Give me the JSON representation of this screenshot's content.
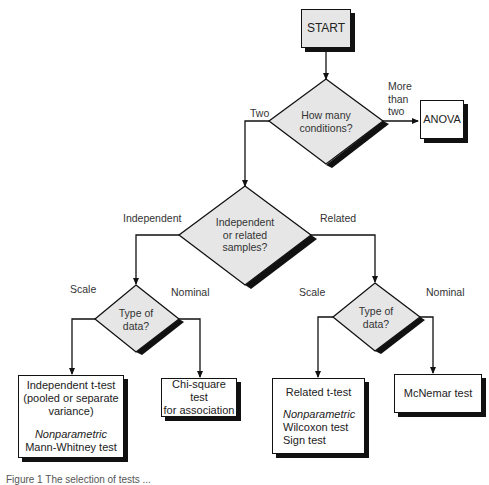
{
  "start": {
    "label": "START"
  },
  "decisions": {
    "conditions": {
      "question_line1": "How many",
      "question_line2": "conditions?"
    },
    "samples": {
      "line1": "Independent",
      "line2": "or related",
      "line3": "samples?"
    },
    "type_left": {
      "line1": "Type of",
      "line2": "data?"
    },
    "type_right": {
      "line1": "Type of",
      "line2": "data?"
    }
  },
  "branch_labels": {
    "two": "Two",
    "more_than_two": [
      "More",
      "than",
      "two"
    ],
    "independent": "Independent",
    "related": "Related",
    "scale_left": "Scale",
    "nominal_left": "Nominal",
    "scale_right": "Scale",
    "nominal_right": "Nominal"
  },
  "outcomes": {
    "anova": "ANOVA",
    "independent_t": {
      "line1": "Independent t-test",
      "line2": "(pooled or separate",
      "line3": "variance)",
      "nonparam_label": "Nonparametric",
      "nonparam_test": "Mann-Whitney test"
    },
    "chi_square": {
      "line1": "Chi-square test",
      "line2": "for association"
    },
    "related_t": {
      "line1": "Related t-test",
      "nonparam_label": "Nonparametric",
      "test1": "Wilcoxon test",
      "test2": "Sign test"
    },
    "mcnemar": "McNemar test"
  },
  "caption": "Figure 1  The selection of tests ..."
}
